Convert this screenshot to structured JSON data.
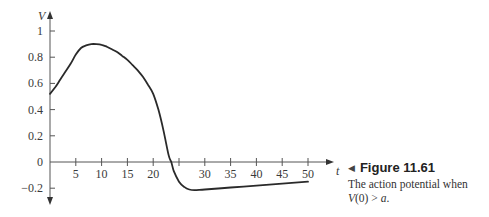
{
  "chart_data": {
    "type": "line",
    "title": "",
    "xlabel": "t",
    "ylabel": "V",
    "xlim": [
      0,
      52
    ],
    "ylim": [
      -0.3,
      1.1
    ],
    "x_ticks": [
      5,
      10,
      15,
      20,
      25,
      30,
      35,
      40,
      45,
      50
    ],
    "x_tick_labels": [
      "5",
      "10",
      "15",
      "20",
      "",
      "30",
      "35",
      "40",
      "45",
      "50"
    ],
    "y_ticks": [
      -0.2,
      0,
      0.2,
      0.4,
      0.6,
      0.8,
      1
    ],
    "y_tick_labels": [
      "−0.2",
      "0",
      "0.2",
      "0.4",
      "0.6",
      "0.8",
      "1"
    ],
    "grid": false,
    "legend": null,
    "series": [
      {
        "name": "V(t)",
        "x": [
          0,
          1,
          2,
          3,
          4,
          5,
          6,
          7,
          8,
          9,
          10,
          11,
          12,
          13,
          14,
          15,
          16,
          17,
          18,
          19,
          20,
          21,
          22,
          23,
          23.5,
          24,
          25,
          26,
          27,
          28,
          30,
          35,
          40,
          45,
          50
        ],
        "values": [
          0.52,
          0.57,
          0.63,
          0.69,
          0.75,
          0.82,
          0.87,
          0.89,
          0.9,
          0.9,
          0.895,
          0.88,
          0.86,
          0.84,
          0.81,
          0.78,
          0.74,
          0.7,
          0.65,
          0.59,
          0.52,
          0.4,
          0.24,
          0.05,
          0.0,
          -0.07,
          -0.15,
          -0.19,
          -0.21,
          -0.215,
          -0.21,
          -0.195,
          -0.18,
          -0.165,
          -0.15
        ],
        "color": "#2a2a2a"
      }
    ]
  },
  "caption": {
    "marker": "◀",
    "title": "Figure 11.61",
    "text_line1": "The action potential when",
    "text_line2_prefix": "V",
    "text_line2_rest": "(0) > ",
    "text_line2_var": "a",
    "text_line2_end": "."
  }
}
